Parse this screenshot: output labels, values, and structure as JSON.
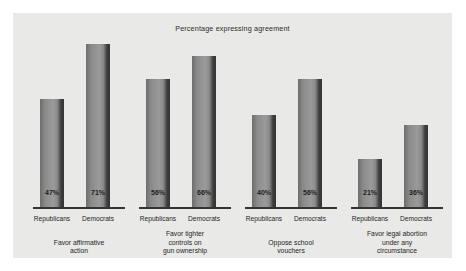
{
  "chart_data": {
    "type": "bar",
    "title": "Percentage expressing agreement",
    "xlabel": "",
    "ylabel": "",
    "ylim": [
      0,
      100
    ],
    "grid": false,
    "legend_position": "none",
    "categories": [
      "Favor affirmative action",
      "Favor tighter controls on gun ownership",
      "Oppose school vouchers",
      "Favor legal abortion under any circumstance"
    ],
    "series": [
      {
        "name": "Republicans",
        "values": [
          47,
          56,
          40,
          21
        ]
      },
      {
        "name": "Democrats",
        "values": [
          71,
          66,
          56,
          36
        ]
      }
    ],
    "value_suffix": "%",
    "groups": [
      {
        "caption_lines": [
          "Favor affirmative",
          "action"
        ],
        "bars": [
          {
            "party": "Republicans",
            "value": 47,
            "label": "47%"
          },
          {
            "party": "Democrats",
            "value": 71,
            "label": "71%"
          }
        ]
      },
      {
        "caption_lines": [
          "Favor tighter",
          "controls on",
          "gun ownership"
        ],
        "bars": [
          {
            "party": "Republicans",
            "value": 56,
            "label": "56%"
          },
          {
            "party": "Democrats",
            "value": 66,
            "label": "66%"
          }
        ]
      },
      {
        "caption_lines": [
          "Oppose school",
          "vouchers"
        ],
        "bars": [
          {
            "party": "Republicans",
            "value": 40,
            "label": "40%"
          },
          {
            "party": "Democrats",
            "value": 56,
            "label": "56%"
          }
        ]
      },
      {
        "caption_lines": [
          "Favor legal abortion",
          "under any",
          "circumstance"
        ],
        "bars": [
          {
            "party": "Republicans",
            "value": 21,
            "label": "21%"
          },
          {
            "party": "Democrats",
            "value": 36,
            "label": "36%"
          }
        ]
      }
    ],
    "colors": {
      "panel_background": "#e9e9e7",
      "page_background": "#ffffff",
      "bar_light": "#9a9a9a",
      "bar_dark": "#3c3c3c",
      "axis_line": "#35352f",
      "text": "#262626"
    }
  }
}
